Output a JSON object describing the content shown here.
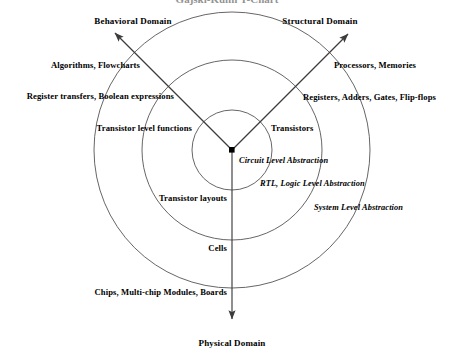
{
  "figure": {
    "title_clipped": "Gajski-Kuhn Y-Chart",
    "background_color": "#ffffff",
    "line_color": "#3c3c3c",
    "text_color": "#000000"
  },
  "center": {
    "x": 232,
    "y": 150,
    "marker": "filled-square"
  },
  "circles": [
    {
      "name": "inner-circle",
      "radius": 40
    },
    {
      "name": "middle-circle",
      "radius": 90
    },
    {
      "name": "outer-circle",
      "radius": 138
    }
  ],
  "axes": [
    {
      "name": "behavioral-axis",
      "domain_label": "Behavioral Domain",
      "domain_label_x": 133,
      "domain_label_y": 21,
      "arrow_tip": {
        "x": 112,
        "y": 30
      },
      "direction_deg": 215
    },
    {
      "name": "structural-axis",
      "domain_label": "Structural Domain",
      "domain_label_x": 320,
      "domain_label_y": 21,
      "arrow_tip": {
        "x": 351,
        "y": 31
      },
      "direction_deg": 325
    },
    {
      "name": "physical-axis",
      "domain_label": "Physical Domain",
      "domain_label_x": 232,
      "domain_label_y": 343,
      "arrow_tip": {
        "x": 232,
        "y": 322
      },
      "direction_deg": 90
    }
  ],
  "behavioral_labels": [
    {
      "text": "Algorithms, Flowcharts",
      "x": 140,
      "y": 65,
      "align": "right"
    },
    {
      "text": "Register transfers, Boolean expressions",
      "x": 174,
      "y": 96,
      "align": "right"
    },
    {
      "text": "Transistor level functions",
      "x": 192,
      "y": 128,
      "align": "right"
    }
  ],
  "structural_labels": [
    {
      "text": "Processors, Memories",
      "x": 334,
      "y": 65,
      "align": "left"
    },
    {
      "text": "Registers, Adders, Gates, Flip-flops",
      "x": 303,
      "y": 97,
      "align": "left"
    },
    {
      "text": "Transistors",
      "x": 271,
      "y": 128,
      "align": "left"
    }
  ],
  "physical_labels": [
    {
      "text": "Transistor layouts",
      "x": 227,
      "y": 198,
      "align": "right"
    },
    {
      "text": "Cells",
      "x": 227,
      "y": 248,
      "align": "right"
    },
    {
      "text": "Chips, Multi-chip Modules, Boards",
      "x": 227,
      "y": 292,
      "align": "right"
    }
  ],
  "abstraction_labels": [
    {
      "text": "Circuit Level Abstraction",
      "x": 239,
      "y": 161,
      "align": "left"
    },
    {
      "text": "RTL, Logic Level Abstraction",
      "x": 260,
      "y": 184,
      "align": "left"
    },
    {
      "text": "System Level Abstraction",
      "x": 314,
      "y": 208,
      "align": "left"
    }
  ]
}
